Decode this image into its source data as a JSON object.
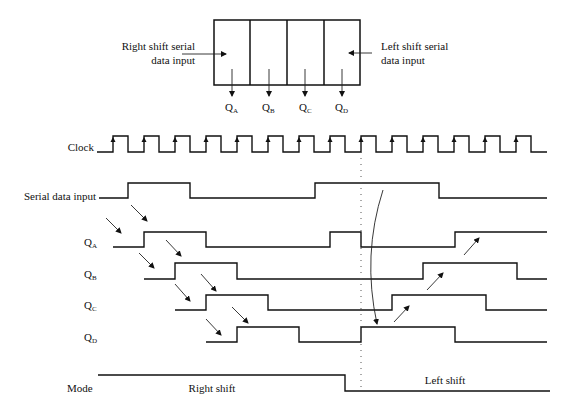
{
  "register": {
    "right_input_label": [
      "Right shift serial",
      "data input"
    ],
    "left_input_label": [
      "Left shift serial",
      "data input"
    ],
    "outputs": [
      {
        "name": "Q",
        "sub": "A"
      },
      {
        "name": "Q",
        "sub": "B"
      },
      {
        "name": "Q",
        "sub": "C"
      },
      {
        "name": "Q",
        "sub": "D"
      }
    ]
  },
  "signals": {
    "clock": "Clock",
    "serial": "Serial data input",
    "qa": {
      "name": "Q",
      "sub": "A"
    },
    "qb": {
      "name": "Q",
      "sub": "B"
    },
    "qc": {
      "name": "Q",
      "sub": "C"
    },
    "qd": {
      "name": "Q",
      "sub": "D"
    },
    "mode": "Mode"
  },
  "mode_labels": {
    "right": "Right shift",
    "left": "Left shift"
  },
  "timing": {
    "clock_rising_edges": [
      113,
      144,
      175,
      206,
      237,
      268,
      299,
      330,
      361,
      392,
      423,
      454,
      485,
      516
    ],
    "serial_data_input": [
      0,
      1,
      0,
      0,
      0,
      0,
      1,
      1,
      1,
      1,
      0,
      0,
      0,
      0
    ],
    "mode_switch_after_edge": 8
  }
}
